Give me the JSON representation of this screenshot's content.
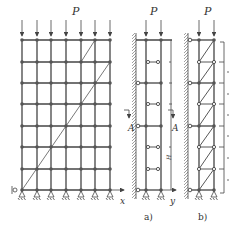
{
  "figure": {
    "load_label": "P",
    "axis_x_label": "x",
    "axis_y_label": "y",
    "section_label": "A",
    "dimension_label": "H",
    "caption_a": "a)",
    "caption_b": "b)",
    "colors": {
      "line": "#444444",
      "node": "#555555",
      "wall_hatch": "#777777"
    }
  },
  "frame": {
    "columns_x": [
      22,
      37,
      51,
      66,
      81,
      95,
      110
    ],
    "rows_y": [
      40,
      62,
      83,
      104,
      126,
      147,
      169,
      190
    ]
  },
  "panel_a": {
    "label": "a)"
  },
  "panel_b": {
    "label": "b)"
  }
}
